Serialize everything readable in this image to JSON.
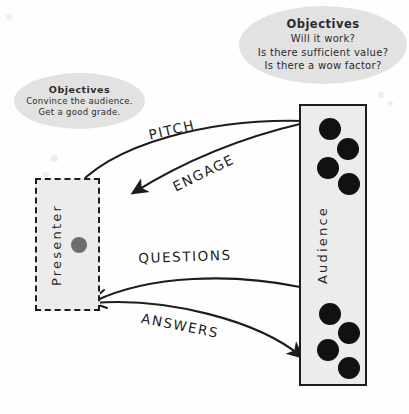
{
  "diagram": {
    "colors": {
      "ink": "#1d1d1d",
      "bubble_fill": "#e2e2e2",
      "box_fill": "#ececec",
      "audience_dot": "#111111",
      "presenter_dot": "#6e6e6e",
      "paper": "#fefefe"
    }
  },
  "bubbles": [
    {
      "id": "presenter-objectives",
      "title": "Objectives",
      "lines": [
        "Convince the audience.",
        "Get a good grade."
      ]
    },
    {
      "id": "audience-objectives",
      "title": "Objectives",
      "lines": [
        "Will it work?",
        "Is there sufficient value?",
        "Is there a wow factor?"
      ]
    }
  ],
  "actors": [
    {
      "id": "presenter",
      "label": "Presenter",
      "border_style": "dashed",
      "people_count": 1
    },
    {
      "id": "audience",
      "label": "Audience",
      "border_style": "solid",
      "people_count": 8
    }
  ],
  "arrows": [
    {
      "id": "pitch",
      "label": "PITCH",
      "from": "presenter",
      "to": "audience"
    },
    {
      "id": "engage",
      "label": "ENGAGE",
      "from": "audience",
      "to": "presenter"
    },
    {
      "id": "questions",
      "label": "QUESTIONS",
      "from": "audience",
      "to": "presenter"
    },
    {
      "id": "answers",
      "label": "ANSWERS",
      "from": "presenter",
      "to": "audience"
    }
  ]
}
